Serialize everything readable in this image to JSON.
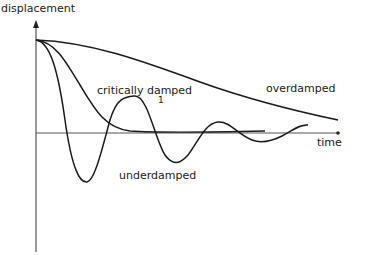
{
  "diagram": {
    "type": "damped-oscillation-curves",
    "axes": {
      "y_label": "displacement",
      "x_label": "time"
    },
    "curves": [
      {
        "name": "overdamped",
        "label": "overdamped"
      },
      {
        "name": "critically-damped",
        "label": "critically damped"
      },
      {
        "name": "underdamped",
        "label": "underdamped"
      }
    ],
    "annotations": {
      "marker": "1"
    },
    "colors": {
      "line": "#1a1a1a",
      "axis": "#555555",
      "background": "#ffffff"
    }
  }
}
